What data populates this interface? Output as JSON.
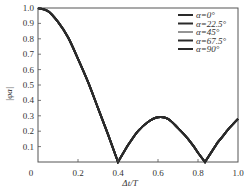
{
  "chart_data": {
    "type": "line",
    "title": "",
    "xlabel": "Δt/T",
    "ylabel": "|φa|",
    "xlim": [
      0,
      1.0
    ],
    "ylim": [
      0,
      1.0
    ],
    "grid": false,
    "legend_position": "upper right",
    "x_ticks": [
      "0",
      "0.2",
      "0.4",
      "0.6",
      "0.8",
      "1.0"
    ],
    "y_ticks": [
      "0.1",
      "0.2",
      "0.3",
      "0.4",
      "0.5",
      "0.6",
      "0.7",
      "0.8",
      "0.9",
      "1.0"
    ],
    "x": [
      0,
      0.05,
      0.1,
      0.15,
      0.2,
      0.25,
      0.3,
      0.35,
      0.4,
      0.45,
      0.5,
      0.55,
      0.6,
      0.65,
      0.7,
      0.75,
      0.8,
      0.835,
      0.9,
      0.95,
      1.0
    ],
    "series": [
      {
        "name": "α=0°",
        "values": [
          1.0,
          0.98,
          0.91,
          0.81,
          0.67,
          0.52,
          0.35,
          0.18,
          0.0,
          0.11,
          0.2,
          0.26,
          0.29,
          0.28,
          0.22,
          0.15,
          0.06,
          0.0,
          0.13,
          0.21,
          0.28
        ]
      },
      {
        "name": "α=22.5°",
        "values": [
          1.0,
          0.98,
          0.91,
          0.81,
          0.67,
          0.52,
          0.35,
          0.18,
          0.0,
          0.11,
          0.2,
          0.26,
          0.29,
          0.28,
          0.22,
          0.15,
          0.06,
          0.0,
          0.13,
          0.21,
          0.28
        ]
      },
      {
        "name": "α=45°",
        "values": [
          1.0,
          0.98,
          0.91,
          0.81,
          0.67,
          0.52,
          0.35,
          0.18,
          0.0,
          0.11,
          0.2,
          0.26,
          0.29,
          0.28,
          0.22,
          0.15,
          0.06,
          0.0,
          0.13,
          0.21,
          0.28
        ]
      },
      {
        "name": "α=67.5°",
        "values": [
          1.0,
          0.98,
          0.91,
          0.81,
          0.67,
          0.52,
          0.35,
          0.18,
          0.0,
          0.11,
          0.2,
          0.26,
          0.29,
          0.28,
          0.22,
          0.15,
          0.06,
          0.0,
          0.13,
          0.21,
          0.28
        ]
      },
      {
        "name": "α=90°",
        "values": [
          1.0,
          0.98,
          0.91,
          0.81,
          0.67,
          0.52,
          0.35,
          0.18,
          0.0,
          0.11,
          0.2,
          0.26,
          0.29,
          0.28,
          0.22,
          0.15,
          0.06,
          0.0,
          0.13,
          0.21,
          0.28
        ]
      }
    ],
    "colors": {
      "line": "#2a2a2a",
      "axis": "#555555",
      "text": "#333333"
    }
  }
}
